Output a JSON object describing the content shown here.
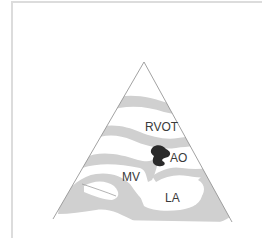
{
  "figure": {
    "view": "parasternal long-axis echocardiographic view (schematic)",
    "colors": {
      "tissue": "#d0d0d0",
      "outline": "#8a8a8a",
      "mass": "#2a2a2a",
      "label": "#3a3a3a",
      "frame": "#dcdcdc"
    },
    "labels": {
      "rvot": "RVOT",
      "ao": "AO",
      "mv": "MV",
      "la": "LA"
    }
  }
}
